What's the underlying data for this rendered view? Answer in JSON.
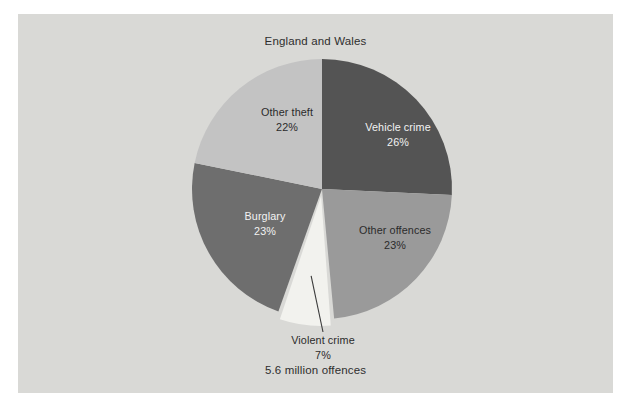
{
  "chart": {
    "title": "England and Wales",
    "footer": "5.6 million offences",
    "background_color": "#d9d9d6",
    "page_color": "#ffffff"
  },
  "chart_data": {
    "type": "pie",
    "title": "England and Wales",
    "subtitle": "",
    "footnote": "5.6 million offences",
    "total_label": "5.6 million offences",
    "total_value": 5.6,
    "total_units": "million offences",
    "xlabel": "",
    "ylabel": "",
    "legend_position": "none",
    "grid": false,
    "start_angle_deg": 0,
    "direction": "clockwise",
    "categories": [
      "Vehicle crime",
      "Other offences",
      "Violent crime",
      "Burglary",
      "Other theft"
    ],
    "values": [
      26,
      23,
      7,
      23,
      22
    ],
    "value_unit": "%",
    "colors": [
      "#545454",
      "#9a9a9a",
      "#f2f2ee",
      "#6e6e6e",
      "#c3c3c3"
    ],
    "slices": [
      {
        "name": "Vehicle crime",
        "label": "Vehicle crime",
        "value": 26,
        "value_label": "26%",
        "color": "#545454",
        "label_color": "light",
        "exploded": false,
        "label_x": 380,
        "label_y": 117
      },
      {
        "name": "Other offences",
        "label": "Other offences",
        "value": 23,
        "value_label": "23%",
        "color": "#9a9a9a",
        "label_color": "dark",
        "exploded": false,
        "label_x": 377,
        "label_y": 220
      },
      {
        "name": "Violent crime",
        "label": "Violent crime",
        "value": 7,
        "value_label": "7%",
        "color": "#f2f2ee",
        "label_color": "dark",
        "exploded": true,
        "label_x": 305,
        "label_y": 330
      },
      {
        "name": "Burglary",
        "label": "Burglary",
        "value": 23,
        "value_label": "23%",
        "color": "#6e6e6e",
        "label_color": "light",
        "exploded": false,
        "label_x": 247,
        "label_y": 206
      },
      {
        "name": "Other theft",
        "label": "Other theft",
        "value": 22,
        "value_label": "22%",
        "color": "#c3c3c3",
        "label_color": "dark",
        "exploded": false,
        "label_x": 269,
        "label_y": 102
      }
    ]
  }
}
